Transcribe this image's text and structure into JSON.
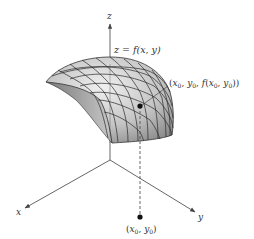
{
  "figure": {
    "axis_labels": {
      "x": "x",
      "y": "y",
      "z": "z"
    },
    "surface_label": "z = f(x, y)",
    "surface_point_label": {
      "open": "(",
      "x0": "x",
      "sub0": "0",
      "comma1": ", ",
      "y0": "y",
      "sub1": "0",
      "comma2": ", ",
      "f": "f",
      "open2": "(",
      "x1": "x",
      "sub2": "0",
      "comma3": ", ",
      "y1": "y",
      "sub3": "0",
      "close": "))"
    },
    "domain_point_label": {
      "open": "(",
      "x": "x",
      "sub0": "0",
      "comma": ", ",
      "y": "y",
      "sub1": "0",
      "close": ")"
    },
    "colors": {
      "surface_light": "#e6e6e6",
      "surface_dark": "#8c8c8c",
      "grid": "#2a2a2a",
      "axis": "#555555",
      "point": "#111111"
    }
  }
}
